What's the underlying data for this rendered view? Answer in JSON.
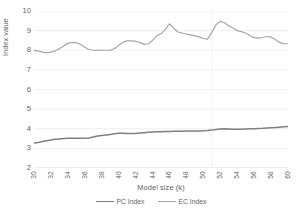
{
  "chart_data": {
    "type": "line",
    "title": "",
    "xlabel": "Model size (k)",
    "ylabel": "Index value",
    "xlim": [
      30,
      60
    ],
    "ylim": [
      2,
      10
    ],
    "ytick_step": 1,
    "grid": true,
    "grid_axis": "y",
    "legend_position": "bottom",
    "x": [
      30,
      30.5,
      31,
      31.5,
      32,
      32.5,
      33,
      33.5,
      34,
      34.5,
      35,
      35.5,
      36,
      36.5,
      37,
      37.5,
      38,
      38.5,
      39,
      39.5,
      40,
      40.5,
      41,
      41.5,
      42,
      42.5,
      43,
      43.5,
      44,
      44.5,
      45,
      45.5,
      46,
      46.5,
      47,
      47.5,
      48,
      48.5,
      49,
      49.5,
      50,
      50.5,
      51,
      51.5,
      52,
      52.5,
      53,
      53.5,
      54,
      54.5,
      55,
      55.5,
      56,
      56.5,
      57,
      57.5,
      58,
      58.5,
      59,
      59.5,
      60
    ],
    "x_tick_labels": [
      "30",
      "32",
      "34",
      "36",
      "38",
      "40",
      "42",
      "44",
      "46",
      "48",
      "50",
      "52",
      "54",
      "56",
      "58",
      "60"
    ],
    "y_tick_labels": [
      "2",
      "3",
      "4",
      "5",
      "6",
      "7",
      "8",
      "9",
      "10"
    ],
    "series": [
      {
        "name": "PC Index",
        "color": "#7f7f7f",
        "line_width": 1.5,
        "values": [
          3.27,
          3.3,
          3.35,
          3.39,
          3.43,
          3.46,
          3.48,
          3.5,
          3.51,
          3.52,
          3.52,
          3.52,
          3.51,
          3.53,
          3.58,
          3.63,
          3.66,
          3.68,
          3.71,
          3.74,
          3.77,
          3.77,
          3.76,
          3.76,
          3.76,
          3.78,
          3.8,
          3.82,
          3.84,
          3.85,
          3.85,
          3.86,
          3.86,
          3.87,
          3.87,
          3.87,
          3.88,
          3.88,
          3.88,
          3.89,
          3.9,
          3.91,
          3.93,
          3.96,
          3.99,
          4.0,
          3.99,
          3.97,
          3.97,
          3.98,
          3.99,
          4.0,
          4.0,
          4.01,
          4.02,
          4.04,
          4.05,
          4.06,
          4.08,
          4.1,
          4.12
        ]
      },
      {
        "name": "EC Index",
        "color": "#a6a6a6",
        "line_width": 1.2,
        "values": [
          7.99,
          7.97,
          7.9,
          7.87,
          7.9,
          7.97,
          8.08,
          8.22,
          8.35,
          8.4,
          8.38,
          8.3,
          8.15,
          8.04,
          8.0,
          7.99,
          8.0,
          8.0,
          8.0,
          8.08,
          8.26,
          8.41,
          8.48,
          8.48,
          8.46,
          8.4,
          8.3,
          8.33,
          8.5,
          8.73,
          8.85,
          9.05,
          9.35,
          9.12,
          8.93,
          8.88,
          8.83,
          8.78,
          8.73,
          8.68,
          8.6,
          8.57,
          8.9,
          9.3,
          9.47,
          9.4,
          9.25,
          9.13,
          9.0,
          8.95,
          8.88,
          8.75,
          8.64,
          8.62,
          8.65,
          8.7,
          8.67,
          8.55,
          8.4,
          8.34,
          8.33
        ]
      }
    ]
  },
  "axes": {
    "y_title": "Index value",
    "x_title": "Model size (k)"
  },
  "legend": {
    "items": [
      {
        "label": "PC Index",
        "color": "#7f7f7f"
      },
      {
        "label": "EC Index",
        "color": "#a6a6a6"
      }
    ]
  },
  "colors": {
    "background": "#ffffff",
    "gridline": "#e8e8e8",
    "axis_line": "#d9d9d9",
    "text": "#636363",
    "pc_index": "#7f7f7f",
    "ec_index": "#a6a6a6"
  }
}
